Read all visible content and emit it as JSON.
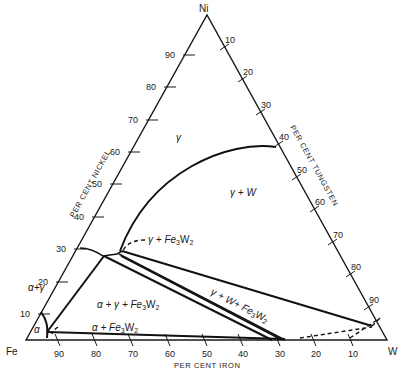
{
  "diagram": {
    "type": "ternary-phase-diagram",
    "system": "Fe-Ni-W",
    "vertices": {
      "top": "Ni",
      "bottom_left": "Fe",
      "bottom_right": "W"
    },
    "axes": {
      "left": {
        "title": "PER CENT NICKEL",
        "ticks": [
          "10",
          "20",
          "30",
          "40",
          "50",
          "60",
          "70",
          "80",
          "90"
        ]
      },
      "right": {
        "title": "PER CENT TUNGSTEN",
        "ticks": [
          "10",
          "20",
          "30",
          "40",
          "50",
          "60",
          "70",
          "80",
          "90"
        ]
      },
      "bottom": {
        "title": "PER CENT IRON",
        "ticks": [
          "90",
          "80",
          "70",
          "60",
          "50",
          "40",
          "30",
          "20",
          "10"
        ]
      }
    },
    "phase_labels": {
      "gamma": "γ",
      "gamma_w": "γ + W",
      "alpha_gamma": "α+γ",
      "alpha": "α",
      "gamma_fe3w2": "γ + Fe",
      "alpha_gamma_fe3w2": "α + γ + Fe",
      "gamma_w_fe3w2": "γ + W+ Fe",
      "alpha_fe3w2": "α + Fe",
      "fe3w2_sub3": "3",
      "fe3w2_W": "W",
      "fe3w2_sub2": "2"
    }
  }
}
